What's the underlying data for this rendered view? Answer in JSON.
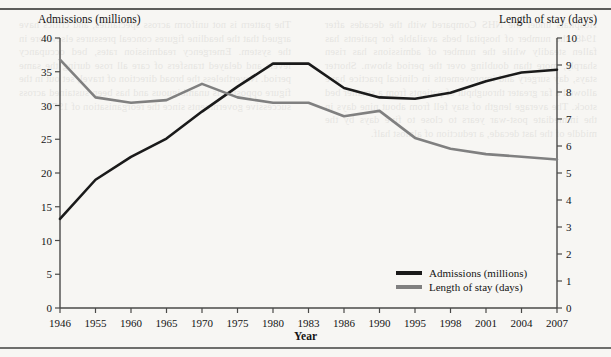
{
  "page": {
    "background_color": "#f7f6f3",
    "rule_color": "#5d5d5b",
    "bleed_text_left": "Hospitals under the NHS Compared with the decades after 1948, the number of hospital beds available for patients has fallen steadily while the number of admissions has risen sharply, more than doubling over the period shown. Shorter stays, day surgery and improvements in clinical practice have allowed a far greater throughput of patients from a smaller bed stock. The average length of stay fell from about nine days in the immediate post-war years to close to five days by the middle of the last decade, a reduction of almost half.",
    "bleed_text_right": "The pattern is not uniform across specialties, and critics have argued that the headline figures conceal pressures elsewhere in the system. Emergency readmission rates, bed occupancy levels and delayed transfers of care all rose during the same period. Nevertheless the broad direction of travel, set out in the figure opposite, is unambiguous and has been sustained across successive governments since the reorganisation of 1974."
  },
  "chart_data": {
    "type": "line",
    "title": "",
    "xlabel": "Year",
    "ylabel": "Admissions (millions)",
    "y2label": "Length of stay (days)",
    "grid": false,
    "legend_position": "bottom-right",
    "categories": [
      "1946",
      "1955",
      "1960",
      "1965",
      "1970",
      "1975",
      "1980",
      "1983",
      "1986",
      "1990",
      "1995",
      "1998",
      "2001",
      "2004",
      "2007"
    ],
    "ylim": [
      0,
      40
    ],
    "yticks": [
      0,
      5,
      10,
      15,
      20,
      25,
      30,
      35,
      40
    ],
    "y2lim": [
      0,
      10
    ],
    "y2ticks": [
      0,
      1,
      2,
      3,
      4,
      5,
      6,
      7,
      8,
      9,
      10
    ],
    "series": [
      {
        "name": "Admissions (millions)",
        "axis": "left",
        "color": "#1a1a1a",
        "values": [
          13.2,
          19.0,
          22.4,
          25.1,
          29.1,
          32.8,
          36.2,
          36.2,
          32.6,
          31.2,
          31.0,
          31.9,
          33.6,
          34.9,
          35.3
        ]
      },
      {
        "name": "Length of stay (days)",
        "axis": "right",
        "color": "#808080",
        "values": [
          9.2,
          7.8,
          7.6,
          7.7,
          8.3,
          7.8,
          7.6,
          7.6,
          7.1,
          7.3,
          6.3,
          5.9,
          5.7,
          5.6,
          5.5
        ]
      }
    ]
  },
  "legend": {
    "items": [
      {
        "label": "Admissions (millions)",
        "color": "#1a1a1a"
      },
      {
        "label": "Length of stay (days)",
        "color": "#808080"
      }
    ]
  }
}
